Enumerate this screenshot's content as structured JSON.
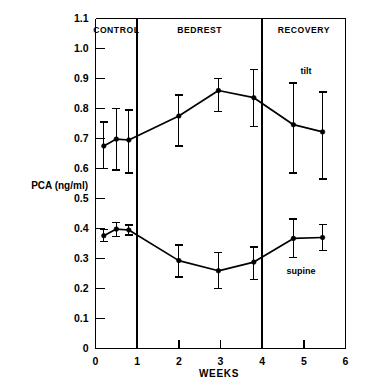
{
  "chart_data": {
    "type": "line",
    "title": "",
    "xlabel": "WEEKS",
    "ylabel": "PCA (ng/ml)",
    "xlim": [
      0,
      6
    ],
    "ylim": [
      0,
      1.1
    ],
    "xticks": [
      "0",
      "1",
      "2",
      "3",
      "4",
      "5",
      "6"
    ],
    "xtick_values": [
      0,
      1,
      2,
      3,
      4,
      5,
      6
    ],
    "yticks": [
      "0",
      "0.1",
      "0.2",
      "0.3",
      "0.4",
      "0.5",
      "0.6",
      "0.7",
      "0.8",
      "0.9",
      "1.0",
      "1.1"
    ],
    "ytick_values": [
      0,
      0.1,
      0.2,
      0.3,
      0.4,
      0.5,
      0.6,
      0.7,
      0.8,
      0.9,
      1.0,
      1.1
    ],
    "grid": false,
    "legend_position": "inline-annotation",
    "phases": [
      {
        "label": "CONTROL",
        "start": 0,
        "end": 1
      },
      {
        "label": "BEDREST",
        "start": 1,
        "end": 4
      },
      {
        "label": "RECOVERY",
        "start": 4,
        "end": 6
      }
    ],
    "phase_dividers": [
      1,
      4
    ],
    "series": [
      {
        "name": "tilt",
        "label": "tilt",
        "label_x": 5.05,
        "label_y": 0.915,
        "x": [
          0.2,
          0.5,
          0.8,
          2.0,
          2.95,
          3.8,
          4.75,
          5.45
        ],
        "values": [
          0.675,
          0.698,
          0.695,
          0.775,
          0.86,
          0.836,
          0.746,
          0.722
        ],
        "err_low": [
          0.6,
          0.595,
          0.585,
          0.675,
          0.79,
          0.74,
          0.585,
          0.565
        ],
        "err_high": [
          0.755,
          0.8,
          0.795,
          0.845,
          0.9,
          0.93,
          0.885,
          0.855
        ]
      },
      {
        "name": "supine",
        "label": "supine",
        "label_x": 4.93,
        "label_y": 0.247,
        "x": [
          0.2,
          0.5,
          0.8,
          2.0,
          2.95,
          3.8,
          4.75,
          5.45
        ],
        "values": [
          0.376,
          0.398,
          0.395,
          0.293,
          0.259,
          0.288,
          0.367,
          0.37
        ],
        "err_low": [
          0.357,
          0.374,
          0.378,
          0.238,
          0.2,
          0.23,
          0.303,
          0.327
        ],
        "err_high": [
          0.396,
          0.42,
          0.412,
          0.345,
          0.321,
          0.338,
          0.432,
          0.414
        ]
      }
    ]
  }
}
